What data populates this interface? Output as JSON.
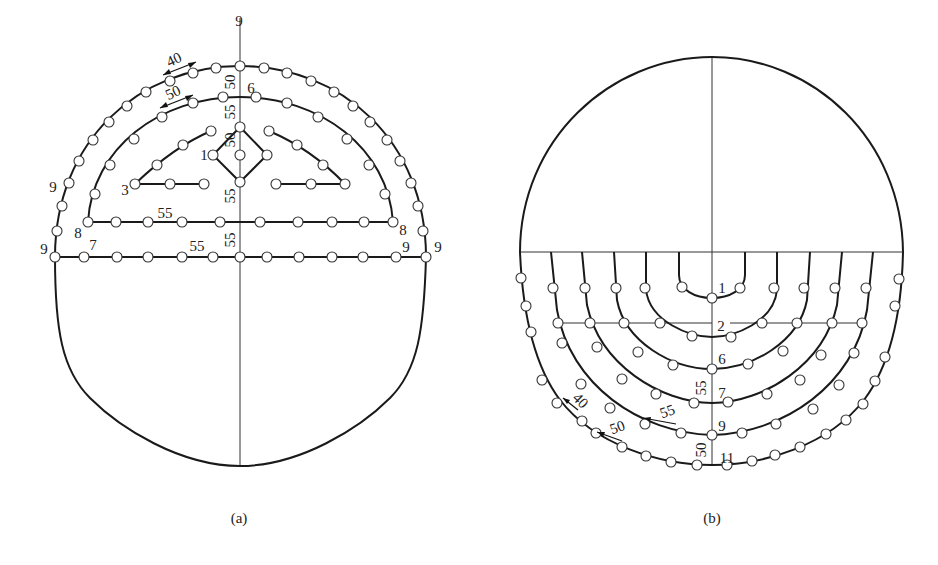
{
  "figure": {
    "panels": [
      {
        "id": "a",
        "caption": "(a)",
        "description": "Upper heading blast-hole layout with cut holes (diamond), helper holes, and perimeter holes",
        "hole_group_labels": [
          {
            "text": "9",
            "x": 239,
            "y": 26
          },
          {
            "text": "6",
            "x": 246,
            "y": 93
          },
          {
            "text": "1",
            "x": 200,
            "y": 160
          },
          {
            "text": "3",
            "x": 122,
            "y": 192
          },
          {
            "text": "9",
            "x": 52,
            "y": 192
          },
          {
            "text": "8",
            "x": 79,
            "y": 236
          },
          {
            "text": "8",
            "x": 401,
            "y": 236
          },
          {
            "text": "9",
            "x": 43,
            "y": 253
          },
          {
            "text": "7",
            "x": 90,
            "y": 250
          },
          {
            "text": "9",
            "x": 404,
            "y": 253
          },
          {
            "text": "9",
            "x": 437,
            "y": 253
          }
        ],
        "spacing_labels": [
          {
            "text": "40",
            "x": 165,
            "y": 63,
            "rotate": -25
          },
          {
            "text": "50",
            "x": 165,
            "y": 95,
            "rotate": -25
          },
          {
            "text": "50",
            "x": 234,
            "y": 86,
            "rotate": -90
          },
          {
            "text": "55",
            "x": 234,
            "y": 116,
            "rotate": -90
          },
          {
            "text": "50",
            "x": 234,
            "y": 146,
            "rotate": -90
          },
          {
            "text": "55",
            "x": 234,
            "y": 202,
            "rotate": -90
          },
          {
            "text": "55",
            "x": 160,
            "y": 218,
            "rotate": 0
          },
          {
            "text": "55",
            "x": 234,
            "y": 243,
            "rotate": -90
          },
          {
            "text": "55",
            "x": 196,
            "y": 251,
            "rotate": 0
          }
        ]
      },
      {
        "id": "b",
        "caption": "(b)",
        "description": "Lower bench blast-hole layout with nested U-shaped hole rows",
        "hole_group_labels": [
          {
            "text": "1",
            "x": 721,
            "y": 292
          },
          {
            "text": "2",
            "x": 721,
            "y": 330
          },
          {
            "text": "6",
            "x": 721,
            "y": 363
          },
          {
            "text": "7",
            "x": 721,
            "y": 397
          },
          {
            "text": "9",
            "x": 721,
            "y": 430
          },
          {
            "text": "11",
            "x": 727,
            "y": 462
          }
        ],
        "spacing_labels": [
          {
            "text": "55",
            "x": 706,
            "y": 388,
            "rotate": -90
          },
          {
            "text": "40",
            "x": 575,
            "y": 405,
            "rotate": 45
          },
          {
            "text": "55",
            "x": 666,
            "y": 418,
            "rotate": -20
          },
          {
            "text": "50",
            "x": 618,
            "y": 433,
            "rotate": -20
          },
          {
            "text": "50",
            "x": 706,
            "y": 452,
            "rotate": -90
          }
        ]
      }
    ]
  }
}
